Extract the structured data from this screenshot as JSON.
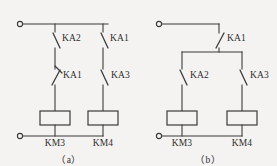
{
  "figure": {
    "background_color": "#f4f3f1",
    "line_color": "#3b3b3b",
    "type": "electrical-ladder-schematic"
  },
  "panels": [
    {
      "id": "a",
      "caption": "（a）",
      "contacts": [
        {
          "label": "KA2",
          "kind": "normally-closed",
          "branch": "left",
          "row": "upper"
        },
        {
          "label": "KA1",
          "kind": "normally-closed",
          "branch": "left",
          "row": "lower"
        },
        {
          "label": "KA1",
          "kind": "normally-open",
          "branch": "right",
          "row": "upper"
        },
        {
          "label": "KA3",
          "kind": "normally-open",
          "branch": "right",
          "row": "lower"
        }
      ],
      "coils": [
        {
          "label": "KM3",
          "branch": "left"
        },
        {
          "label": "KM4",
          "branch": "right"
        }
      ],
      "terminals": [
        {
          "position": "top-left"
        },
        {
          "position": "bottom-left"
        }
      ]
    },
    {
      "id": "b",
      "caption": "（b）",
      "contacts": [
        {
          "label": "KA1",
          "kind": "normally-open",
          "branch": "feed",
          "row": "upper"
        },
        {
          "label": "KA2",
          "kind": "normally-open",
          "branch": "left",
          "row": "lower"
        },
        {
          "label": "KA3",
          "kind": "normally-open",
          "branch": "right",
          "row": "lower"
        }
      ],
      "coils": [
        {
          "label": "KM3",
          "branch": "left"
        },
        {
          "label": "KM4",
          "branch": "right"
        }
      ],
      "terminals": [
        {
          "position": "top-left"
        },
        {
          "position": "bottom-left"
        }
      ]
    }
  ]
}
